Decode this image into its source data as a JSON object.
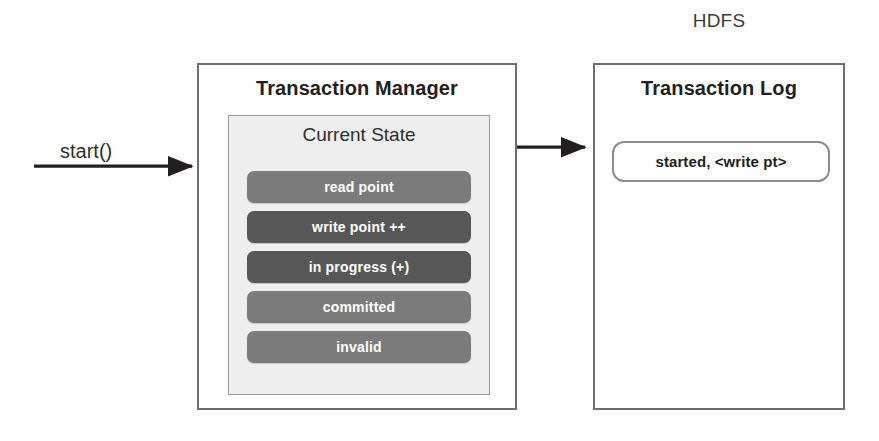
{
  "diagram": {
    "hdfs_label": "HDFS",
    "transaction_manager": {
      "title": "Transaction Manager",
      "current_state": {
        "title": "Current State",
        "items": [
          {
            "label": "read point",
            "shade": "light"
          },
          {
            "label": "write point ++",
            "shade": "dark"
          },
          {
            "label": "in progress (+)",
            "shade": "dark"
          },
          {
            "label": "committed",
            "shade": "light"
          },
          {
            "label": "invalid",
            "shade": "light"
          }
        ]
      }
    },
    "transaction_log": {
      "title": "Transaction Log",
      "entry": "started, <write pt>"
    },
    "arrows": [
      {
        "name": "start-arrow",
        "label": "start()"
      },
      {
        "name": "link-arrow",
        "label": ""
      }
    ],
    "colors": {
      "background": "#ffffff",
      "box_border": "#6e6e6e",
      "inner_panel_fill": "#eeeeee",
      "inner_panel_border": "#9a9a9a",
      "pill_light": "#7b7b7b",
      "pill_dark": "#575757",
      "text_dark": "#231f20",
      "arrow": "#231f20"
    }
  }
}
